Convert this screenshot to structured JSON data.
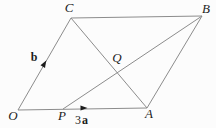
{
  "figure": {
    "canvas": {
      "width": 216,
      "height": 128,
      "background": "#fcfcfc"
    },
    "style": {
      "line_color": "#8c8c8c",
      "line_width": 1,
      "label_color": "#1c1c1c",
      "arrow_color": "#1c1c1c",
      "font_size": 13
    },
    "points": {
      "O": {
        "x": 18,
        "y": 110
      },
      "A": {
        "x": 147,
        "y": 108
      },
      "B": {
        "x": 202,
        "y": 16
      },
      "C": {
        "x": 71,
        "y": 18
      },
      "P": {
        "x": 63,
        "y": 109
      },
      "Q": {
        "x": 117,
        "y": 71
      }
    },
    "edges": [
      {
        "from": "O",
        "to": "A"
      },
      {
        "from": "O",
        "to": "C"
      },
      {
        "from": "C",
        "to": "B"
      },
      {
        "from": "A",
        "to": "B"
      },
      {
        "from": "C",
        "to": "A"
      },
      {
        "from": "P",
        "to": "B"
      }
    ],
    "arrows": [
      {
        "id": "b",
        "x": 46,
        "y": 61,
        "angle": -60
      },
      {
        "id": "3a",
        "x": 87,
        "y": 107.9,
        "angle": -1
      }
    ],
    "labels": [
      {
        "id": "O",
        "text": "O",
        "x": 13,
        "y": 120,
        "italic": true,
        "bold": false,
        "size": 13
      },
      {
        "id": "P",
        "text": "P",
        "x": 62,
        "y": 120,
        "italic": true,
        "bold": false,
        "size": 13
      },
      {
        "id": "A",
        "text": "A",
        "x": 149,
        "y": 118,
        "italic": true,
        "bold": false,
        "size": 13
      },
      {
        "id": "B",
        "text": "B",
        "x": 206,
        "y": 13,
        "italic": true,
        "bold": false,
        "size": 13
      },
      {
        "id": "C",
        "text": "C",
        "x": 69,
        "y": 12,
        "italic": true,
        "bold": false,
        "size": 13
      },
      {
        "id": "Q",
        "text": "Q",
        "x": 117,
        "y": 62,
        "italic": true,
        "bold": false,
        "size": 13
      },
      {
        "id": "vec-b",
        "text": "b",
        "x": 34,
        "y": 61,
        "italic": false,
        "bold": true,
        "size": 12
      },
      {
        "id": "coef-3",
        "text": "3",
        "x": 78,
        "y": 124,
        "italic": false,
        "bold": false,
        "size": 12
      },
      {
        "id": "vec-a",
        "text": "a",
        "x": 85,
        "y": 124,
        "italic": false,
        "bold": true,
        "size": 12
      }
    ]
  }
}
